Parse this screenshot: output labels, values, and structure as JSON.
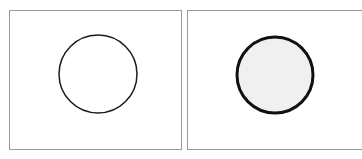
{
  "panels": [
    {
      "id": "left",
      "shape": "circle",
      "state": "unfilled",
      "stroke_color": "#1a1a1a",
      "stroke_width": 1.5,
      "fill_color": "#ffffff"
    },
    {
      "id": "right",
      "shape": "circle",
      "state": "filled-bold",
      "stroke_color": "#111111",
      "stroke_width": 3,
      "fill_color": "#f0f0f0"
    }
  ]
}
